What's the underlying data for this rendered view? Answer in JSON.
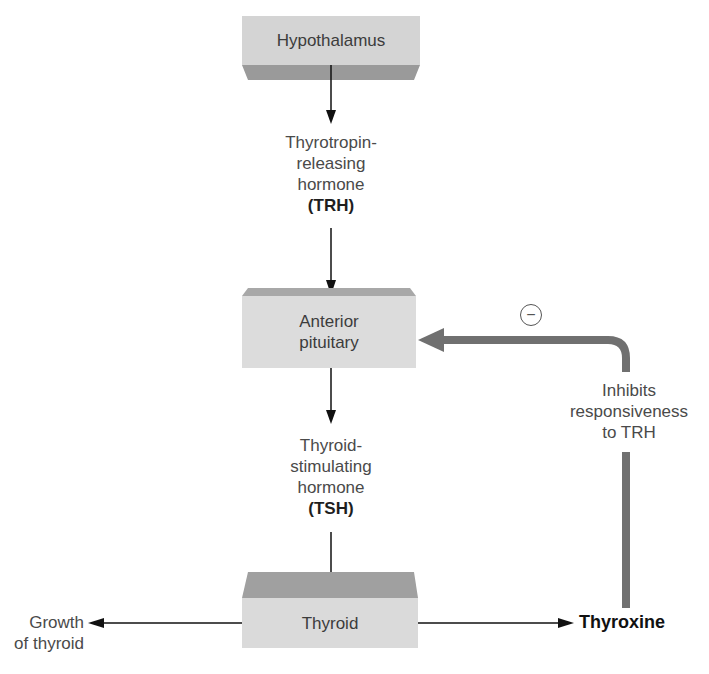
{
  "diagram": {
    "type": "endocrine feedback pathway",
    "nodes": {
      "hypothalamus": {
        "label": "Hypothalamus"
      },
      "anterior_pituitary": {
        "label_line1": "Anterior",
        "label_line2": "pituitary"
      },
      "thyroid": {
        "label": "Thyroid"
      }
    },
    "hormones": {
      "trh": {
        "line1": "Thyrotropin-",
        "line2": "releasing",
        "line3": "hormone",
        "abbr": "(TRH)"
      },
      "tsh": {
        "line1": "Thyroid-",
        "line2": "stimulating",
        "line3": "hormone",
        "abbr": "(TSH)"
      }
    },
    "outputs": {
      "growth": {
        "line1": "Growth",
        "line2": "of thyroid"
      },
      "thyroxine": {
        "label": "Thyroxine"
      }
    },
    "feedback": {
      "sign": "−",
      "line1": "Inhibits",
      "line2": "responsiveness",
      "line3": "to TRH"
    },
    "edges": [
      {
        "from": "Hypothalamus",
        "to": "Anterior pituitary",
        "via": "TRH"
      },
      {
        "from": "Anterior pituitary",
        "to": "Thyroid",
        "via": "TSH"
      },
      {
        "from": "Thyroid",
        "to": "Growth of thyroid"
      },
      {
        "from": "Thyroid",
        "to": "Thyroxine"
      },
      {
        "from": "Thyroxine",
        "to": "Anterior pituitary",
        "type": "negative feedback"
      }
    ],
    "colors": {
      "box_face": "#d6d6d6",
      "box_bevel": "#9a9a9a",
      "feedback_arrow": "#707070",
      "line": "#111111"
    }
  }
}
